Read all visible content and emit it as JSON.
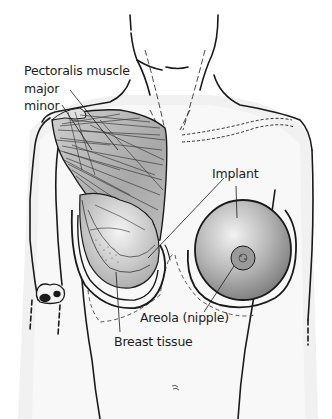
{
  "figure": {
    "labels": {
      "pectoralis": "Pectoralis muscle",
      "major": "major",
      "minor": "minor",
      "implant": "Implant",
      "areola": "Areola (nipple)",
      "breast_tissue": "Breast tissue"
    },
    "colors": {
      "outline": "#1a1a1a",
      "muscle_shade": "#9a9a9a",
      "implant_shade": "#8e8e8e",
      "background": "#ffffff"
    }
  }
}
